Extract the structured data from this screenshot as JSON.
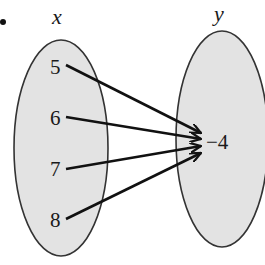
{
  "diagram": {
    "type": "mapping",
    "bullet": "•",
    "domain_set": {
      "label": "x",
      "elements": [
        "5",
        "6",
        "7",
        "8"
      ]
    },
    "range_set": {
      "label": "y",
      "elements": [
        "−4"
      ]
    },
    "mappings": [
      {
        "from": "5",
        "to": "−4"
      },
      {
        "from": "6",
        "to": "−4"
      },
      {
        "from": "7",
        "to": "−4"
      },
      {
        "from": "8",
        "to": "−4"
      }
    ],
    "colors": {
      "ellipse_fill": "#e3e3e3",
      "ellipse_stroke": "#333333",
      "arrow": "#111111",
      "text": "#1a1a1a"
    }
  }
}
